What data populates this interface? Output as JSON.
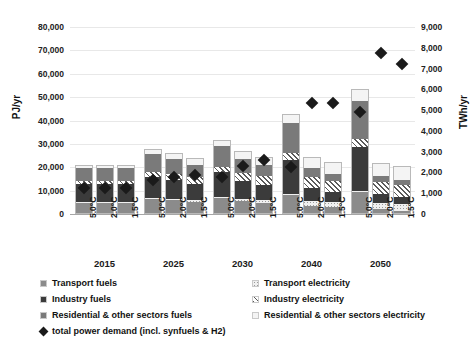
{
  "chart_data": {
    "type": "bar",
    "title": "",
    "subtitle": "",
    "stacked": true,
    "ylabel": "PJ/yr",
    "ylabel_right": "TWh/yr",
    "xlabel": "",
    "ylim": [
      0,
      80000
    ],
    "ylim_right": [
      0,
      9000
    ],
    "yticks": [
      "0",
      "10,000",
      "20,000",
      "30,000",
      "40,000",
      "50,000",
      "60,000",
      "70,000",
      "80,000"
    ],
    "ytick_values": [
      0,
      10000,
      20000,
      30000,
      40000,
      50000,
      60000,
      70000,
      80000
    ],
    "yticks_right": [
      "0",
      "1,000",
      "2,000",
      "3,000",
      "4,000",
      "5,000",
      "6,000",
      "7,000",
      "8,000",
      "9,000"
    ],
    "ytick_values_right": [
      0,
      1000,
      2000,
      3000,
      4000,
      5000,
      6000,
      7000,
      8000,
      9000
    ],
    "grid": true,
    "legend_position": "bottom",
    "groups": [
      "2015",
      "2025",
      "2030",
      "2040",
      "2050"
    ],
    "scenarios": [
      "5.0°C",
      "2.0°C",
      "1.5°C"
    ],
    "categories": [
      "2015 5.0°C",
      "2015 2.0°C",
      "2015 1.5°C",
      "2025 5.0°C",
      "2025 2.0°C",
      "2025 1.5°C",
      "2030 5.0°C",
      "2030 2.0°C",
      "2030 1.5°C",
      "2040 5.0°C",
      "2040 2.0°C",
      "2040 1.5°C",
      "2050 5.0°C",
      "2050 2.0°C",
      "2050 1.5°C"
    ],
    "series": [
      {
        "name": "Transport fuels",
        "key": "trf",
        "color": "#8b8b8b",
        "pattern": "solid",
        "values": [
          5000,
          5000,
          5000,
          6400,
          5800,
          5200,
          7000,
          5400,
          4600,
          8300,
          3600,
          2800,
          9500,
          2100,
          1500
        ]
      },
      {
        "name": "Transport electricity",
        "key": "tre",
        "color": "#f0f0f0",
        "pattern": "dotted",
        "values": [
          200,
          200,
          200,
          300,
          500,
          700,
          300,
          900,
          1400,
          400,
          2100,
          2400,
          500,
          2700,
          2900
        ]
      },
      {
        "name": "Industry fuels",
        "key": "indf",
        "color": "#3b3b3b",
        "pattern": "solid",
        "values": [
          7500,
          7500,
          7500,
          9300,
          8200,
          7100,
          10600,
          8000,
          6500,
          14600,
          5600,
          4400,
          18700,
          3600,
          2700
        ]
      },
      {
        "name": "Industry electricity",
        "key": "inde",
        "color": "#ffffff",
        "pattern": "hatched",
        "values": [
          1600,
          1600,
          1600,
          2100,
          2500,
          2700,
          2300,
          3200,
          3600,
          2900,
          4500,
          4700,
          3400,
          5300,
          5500
        ]
      },
      {
        "name": "Residential & other sectors fuels",
        "key": "resf",
        "color": "#7a7a7a",
        "pattern": "solid",
        "values": [
          5200,
          5200,
          5200,
          7400,
          6500,
          5400,
          8900,
          6100,
          4700,
          12900,
          3900,
          3000,
          16400,
          2600,
          2000
        ]
      },
      {
        "name": "Residential & other sectors electricity",
        "key": "rese",
        "color": "#f4f4f4",
        "pattern": "solid",
        "values": [
          1500,
          1500,
          1500,
          2400,
          2600,
          2900,
          2700,
          3300,
          3600,
          3900,
          4800,
          5000,
          4800,
          5600,
          5800
        ]
      }
    ],
    "marker_series": {
      "name": "total power demand (incl. synfuels & H2)",
      "axis": "right",
      "unit": "TWh/yr",
      "marker": "diamond",
      "color": "#1a1a1a",
      "values": [
        1250,
        1250,
        1250,
        1650,
        1800,
        1900,
        1800,
        2300,
        2600,
        2250,
        5350,
        5350,
        4900,
        7750,
        7200
      ]
    },
    "legend_left": [
      {
        "label": "Transport fuels",
        "swatch": "trf"
      },
      {
        "label": "Industry fuels",
        "swatch": "indf"
      },
      {
        "label": "Residential & other sectors fuels",
        "swatch": "resf"
      },
      {
        "label": "total power demand (incl. synfuels & H2)",
        "swatch": "diamond"
      }
    ],
    "legend_right": [
      {
        "label": "Transport electricity",
        "swatch": "tre"
      },
      {
        "label": "Industry electricity",
        "swatch": "inde"
      },
      {
        "label": "Residential & other sectors electricity",
        "swatch": "rese"
      }
    ]
  }
}
